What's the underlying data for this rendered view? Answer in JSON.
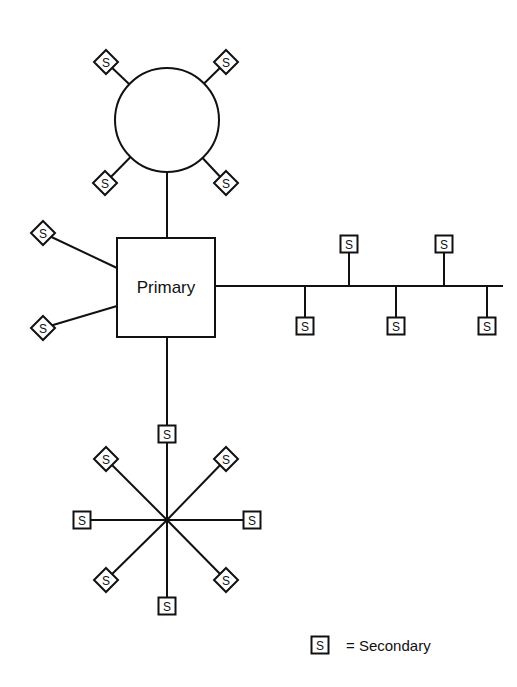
{
  "diagram": {
    "primary": {
      "label": "Primary",
      "x": 117,
      "y": 238,
      "w": 98,
      "h": 99
    },
    "secondary_symbol": "S",
    "ring": {
      "center": [
        167,
        120
      ],
      "radius": 52,
      "nodes": [
        {
          "shape": "diamond",
          "x": 106,
          "y": 62
        },
        {
          "shape": "diamond",
          "x": 226,
          "y": 62
        },
        {
          "shape": "diamond",
          "x": 105,
          "y": 183
        },
        {
          "shape": "diamond",
          "x": 226,
          "y": 183
        }
      ]
    },
    "direct_links": [
      {
        "shape": "diamond",
        "x": 43,
        "y": 233,
        "attach": [
          117,
          268
        ]
      },
      {
        "shape": "diamond",
        "x": 43,
        "y": 328,
        "attach": [
          117,
          306
        ]
      }
    ],
    "bus": {
      "y": 286,
      "x_start": 215,
      "x_end": 503,
      "taps": [
        {
          "x": 305,
          "side": "down"
        },
        {
          "x": 349,
          "side": "up"
        },
        {
          "x": 396,
          "side": "down"
        },
        {
          "x": 444,
          "side": "up"
        },
        {
          "x": 487,
          "side": "down"
        }
      ]
    },
    "star": {
      "center": [
        167,
        520
      ],
      "nodes": [
        {
          "shape": "square",
          "x": 167,
          "y": 434
        },
        {
          "shape": "square",
          "x": 167,
          "y": 606
        },
        {
          "shape": "square",
          "x": 82,
          "y": 520
        },
        {
          "shape": "square",
          "x": 252,
          "y": 520
        },
        {
          "shape": "diamond",
          "x": 106,
          "y": 459
        },
        {
          "shape": "diamond",
          "x": 226,
          "y": 459
        },
        {
          "shape": "diamond",
          "x": 106,
          "y": 580
        },
        {
          "shape": "diamond",
          "x": 226,
          "y": 580
        }
      ]
    },
    "legend": {
      "symbol": "S",
      "text": "= Secondary",
      "x": 320,
      "y": 645
    }
  }
}
